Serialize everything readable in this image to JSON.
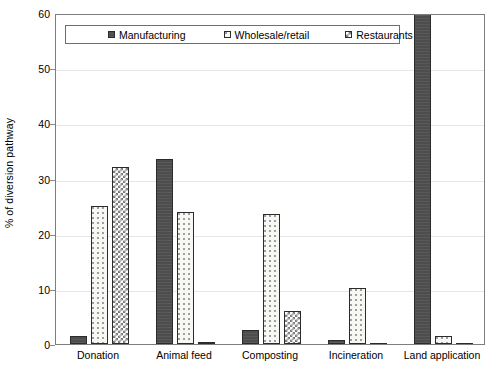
{
  "chart_data": {
    "type": "bar",
    "title": "",
    "xlabel": "",
    "ylabel": "% of diversion pathway",
    "ylim": [
      0,
      60
    ],
    "yticks": [
      0,
      10,
      20,
      30,
      40,
      50,
      60
    ],
    "ytick_labels": [
      "0",
      "10",
      "20",
      "30",
      "40",
      "50",
      "60"
    ],
    "grid": true,
    "legend_position": "top-left-inside",
    "categories": [
      "Donation",
      "Animal feed",
      "Composting",
      "Incineration",
      "Land application"
    ],
    "series": [
      {
        "name": "Manufacturing",
        "pattern": "solid-dark-gray",
        "color": "#4d4d4d",
        "values": [
          1.5,
          33.5,
          2.5,
          0.7,
          60.0
        ]
      },
      {
        "name": "Wholesale/retail",
        "pattern": "light-dotted",
        "color": "#f7f7f4",
        "values": [
          25.0,
          24.0,
          23.5,
          10.2,
          1.5
        ]
      },
      {
        "name": "Restaurants",
        "pattern": "checkered",
        "color": "#7a7a7a",
        "values": [
          32.0,
          0.3,
          6.0,
          0.0,
          0.0
        ]
      }
    ]
  },
  "axes": {
    "y_title": "% of diversion pathway"
  }
}
